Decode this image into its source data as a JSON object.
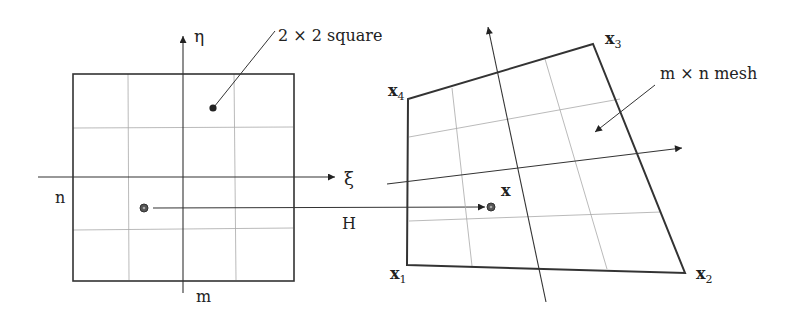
{
  "figure": {
    "left_panel": {
      "shape": "2 × 2 square",
      "label_square": "2 × 2 square",
      "axis_xi": "ξ",
      "axis_eta": "η",
      "label_n": "n",
      "label_m": "m"
    },
    "mapping": {
      "label": "H"
    },
    "right_panel": {
      "label_mesh": "m × n mesh",
      "point_label": "x",
      "vertices": [
        {
          "name": "x",
          "sub": "1"
        },
        {
          "name": "x",
          "sub": "2"
        },
        {
          "name": "x",
          "sub": "3"
        },
        {
          "name": "x",
          "sub": "4"
        }
      ]
    },
    "colors": {
      "stroke": "#333333",
      "grid": "#9a9a9a",
      "text": "#222222"
    }
  }
}
